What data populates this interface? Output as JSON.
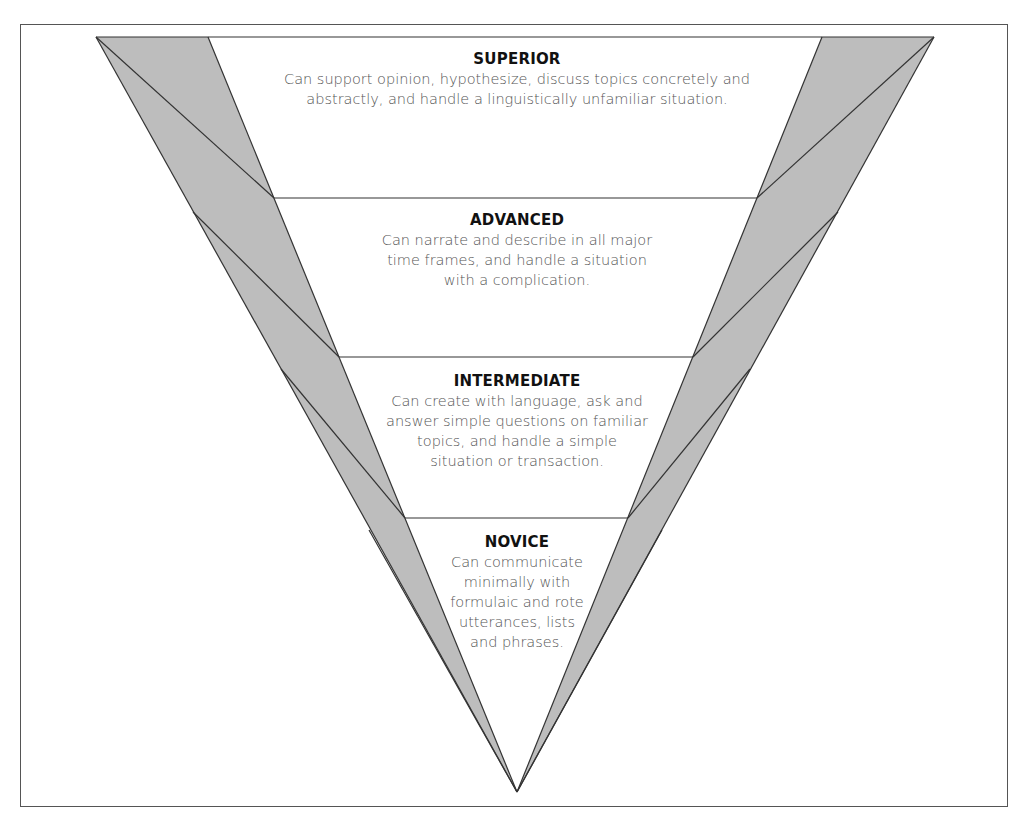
{
  "diagram": {
    "type": "inverted-pyramid",
    "colors": {
      "band_fill": "#bdbdbd",
      "stroke": "#333333",
      "title": "#111111",
      "body": "#555555"
    },
    "levels": [
      {
        "title": "SUPERIOR",
        "lines": [
          "Can support opinion, hypothesize, discuss topics concretely and",
          "abstractly, and handle a linguistically unfamiliar situation."
        ]
      },
      {
        "title": "ADVANCED",
        "lines": [
          "Can narrate and describe in all major",
          "time frames, and handle a situation",
          "with a complication."
        ]
      },
      {
        "title": "INTERMEDIATE",
        "lines": [
          "Can create with language, ask and",
          "answer simple questions on familiar",
          "topics, and handle a simple",
          "situation or transaction."
        ]
      },
      {
        "title": "NOVICE",
        "lines": [
          "Can communicate",
          "minimally with",
          "formulaic and rote",
          "utterances, lists",
          "and phrases."
        ]
      }
    ]
  }
}
